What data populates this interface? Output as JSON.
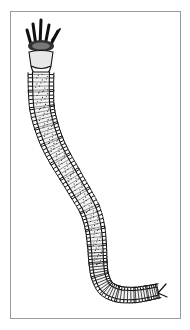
{
  "figure": {
    "style": "black ink line drawing",
    "colors": {
      "ink": "#111111",
      "frame": "#9a9a9a",
      "background": "#ffffff"
    }
  }
}
